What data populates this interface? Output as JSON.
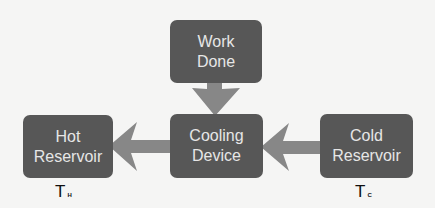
{
  "diagram": {
    "nodes": {
      "work_done": {
        "line1": "Work",
        "line2": "Done"
      },
      "cooling_device": {
        "line1": "Cooling",
        "line2": "Device"
      },
      "hot_reservoir": {
        "line1": "Hot",
        "line2": "Reservoir"
      },
      "cold_reservoir": {
        "line1": "Cold",
        "line2": "Reservoir"
      }
    },
    "labels": {
      "hot_temp": {
        "symbol": "T",
        "subscript": "H"
      },
      "cold_temp": {
        "symbol": "T",
        "subscript": "C"
      }
    },
    "edges": [
      {
        "from": "Work Done",
        "to": "Cooling Device"
      },
      {
        "from": "Cooling Device",
        "to": "Hot Reservoir"
      },
      {
        "from": "Cold Reservoir",
        "to": "Cooling Device"
      }
    ],
    "colors": {
      "box": "#575757",
      "arrow": "#878787",
      "box_text": "#e6e6e6",
      "background": "#f5f5f4"
    }
  }
}
